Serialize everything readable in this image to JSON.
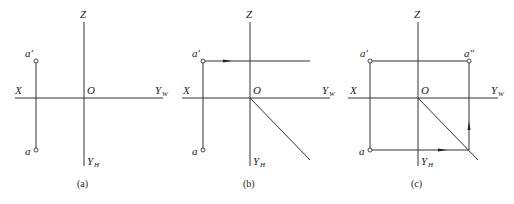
{
  "panels": [
    {
      "caption": "(a)",
      "labels": {
        "z": "Z",
        "x": "X",
        "o": "O",
        "yw": "Y",
        "yw_sub": "W",
        "yh": "Y",
        "yh_sub": "H",
        "a_prime": "a′",
        "a": "a"
      }
    },
    {
      "caption": "(b)",
      "labels": {
        "z": "Z",
        "x": "X",
        "o": "O",
        "yw": "Y",
        "yw_sub": "W",
        "yh": "Y",
        "yh_sub": "H",
        "a_prime": "a′",
        "a": "a"
      }
    },
    {
      "caption": "(c)",
      "labels": {
        "z": "Z",
        "x": "X",
        "o": "O",
        "yw": "Y",
        "yw_sub": "W",
        "yh": "Y",
        "yh_sub": "H",
        "a_prime": "a′",
        "a_double_prime": "a″",
        "a": "a"
      }
    }
  ],
  "colors": {
    "line": "#333333",
    "text": "#222222",
    "background": "#ffffff"
  }
}
